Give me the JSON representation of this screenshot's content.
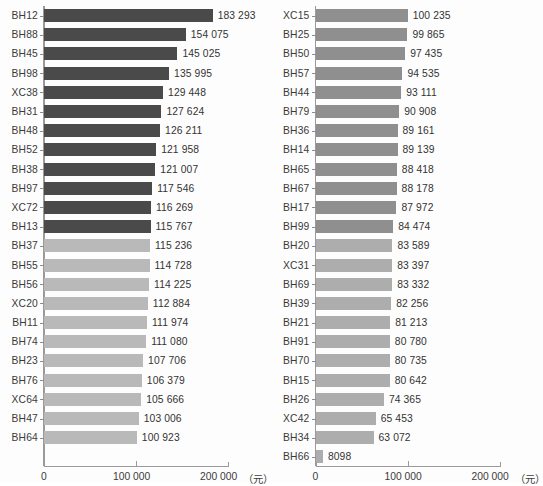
{
  "chart_data": {
    "type": "bar",
    "orientation": "horizontal",
    "title": "",
    "xlabel": "(元)",
    "ylabel": "",
    "xlim": [
      0,
      200000
    ],
    "xticks": [
      0,
      100000,
      200000
    ],
    "xtick_labels": [
      "0",
      "100 000",
      "200 000"
    ],
    "unit_label": "（元）",
    "grid": false,
    "legend": "none",
    "panels": [
      {
        "name": "left-panel",
        "categories": [
          "BH12",
          "BH88",
          "BH45",
          "BH98",
          "XC38",
          "BH31",
          "BH48",
          "BH52",
          "BH38",
          "BH97",
          "XC72",
          "BH13",
          "BH37",
          "BH55",
          "BH56",
          "XC20",
          "BH11",
          "BH74",
          "BH23",
          "BH76",
          "XC64",
          "BH47",
          "BH64"
        ],
        "values": [
          183293,
          154075,
          145025,
          135995,
          129448,
          127624,
          126211,
          121958,
          121007,
          117546,
          116269,
          115767,
          115236,
          114728,
          114225,
          112884,
          111974,
          111080,
          107706,
          106379,
          105666,
          103006,
          100923
        ],
        "value_labels": [
          "183 293",
          "154 075",
          "145 025",
          "135 995",
          "129 448",
          "127 624",
          "126 211",
          "121 958",
          "121 007",
          "117 546",
          "116 269",
          "115 767",
          "115 236",
          "114 728",
          "114 225",
          "112 884",
          "111 974",
          "111 080",
          "107 706",
          "106 379",
          "105 666",
          "103 006",
          "100 923"
        ],
        "shades": [
          "dark",
          "dark",
          "dark",
          "dark",
          "dark",
          "dark",
          "dark",
          "dark",
          "dark",
          "dark",
          "dark",
          "dark",
          "light",
          "light",
          "light",
          "light",
          "light",
          "light",
          "light",
          "light",
          "light",
          "light",
          "light"
        ]
      },
      {
        "name": "right-panel",
        "categories": [
          "XC15",
          "BH25",
          "BH50",
          "BH57",
          "BH44",
          "BH79",
          "BH36",
          "BH14",
          "BH65",
          "BH67",
          "BH17",
          "BH99",
          "BH20",
          "XC31",
          "BH69",
          "BH39",
          "BH21",
          "BH91",
          "BH70",
          "BH15",
          "BH26",
          "XC42",
          "BH34",
          "BH66"
        ],
        "values": [
          100235,
          99865,
          97435,
          94535,
          93111,
          90908,
          89161,
          89139,
          88418,
          88178,
          87972,
          84474,
          83589,
          83397,
          83332,
          82256,
          81213,
          80780,
          80735,
          80642,
          74365,
          65453,
          63072,
          8098
        ],
        "value_labels": [
          "100 235",
          "99 865",
          "97 435",
          "94 535",
          "93 111",
          "90 908",
          "89 161",
          "89 139",
          "88 418",
          "88 178",
          "87 972",
          "84 474",
          "83 589",
          "83 397",
          "83 332",
          "82 256",
          "81 213",
          "80 780",
          "80 735",
          "80 642",
          "74 365",
          "65 453",
          "63 072",
          "8098"
        ],
        "shades": [
          "mid",
          "mid",
          "mid",
          "mid",
          "mid",
          "mid",
          "mid",
          "mid",
          "mid",
          "mid",
          "mid",
          "mid",
          "mid-light",
          "mid-light",
          "mid-light",
          "mid-light",
          "mid-light",
          "mid-light",
          "mid-light",
          "mid-light",
          "mid-light",
          "mid-light",
          "mid-light",
          "mid-light"
        ]
      }
    ],
    "colors": {
      "dark": "#4a4a4a",
      "light": "#b9b9b9",
      "mid": "#8f8f8f",
      "mid_light": "#adadad",
      "axis": "#9a9a9a",
      "text": "#333333",
      "background": "#fdfdfd"
    }
  }
}
